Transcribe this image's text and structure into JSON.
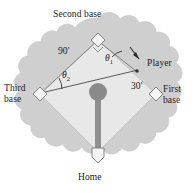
{
  "figure": {
    "type": "diagram",
    "background_color": "#ffffff",
    "field_blob_color": "#cfcfcf",
    "infield_color": "#e8e8e8",
    "mound_color": "#8a8a8a",
    "line_color": "#555555",
    "text_color": "#1a1a1a"
  },
  "labels": {
    "second_base": "Second base",
    "third_base": "Third base",
    "first_base": "First base",
    "home": "Home",
    "player": "Player",
    "distance_baseline": "90'",
    "distance_player": "30'",
    "angle_one": "θ",
    "angle_one_sub": "1",
    "angle_two": "θ",
    "angle_two_sub": "2"
  },
  "geometry": {
    "second_base_point": [
      98,
      40
    ],
    "third_base_point": [
      40,
      94
    ],
    "first_base_point": [
      156,
      94
    ],
    "home_plate_point": [
      98,
      152
    ],
    "mound_point": [
      98,
      94
    ],
    "player_point": [
      133,
      72
    ],
    "baseline_length_label": "90'",
    "player_offset_label": "30'"
  },
  "icons": {
    "base_diamond": "diamond-icon",
    "home_plate": "home-plate-icon",
    "pitcher_mound": "circle-icon",
    "player_arrow": "arrow-icon"
  }
}
